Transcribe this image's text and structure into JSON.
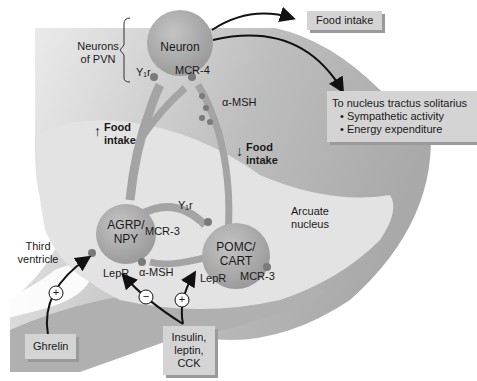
{
  "diagram": {
    "pvn": {
      "group_label_line1": "Neurons",
      "group_label_line2": "of PVN",
      "neuron_label": "Neuron",
      "receptor_mcr4": "MCR-4",
      "receptor_y1r": "Y₁r"
    },
    "outputs": {
      "food_intake_box": "Food intake",
      "nts_box_title": "To nucleus tractus solitarius",
      "nts_box_items": [
        "• Sympathetic activity",
        "• Energy expenditure"
      ]
    },
    "alpha_msh_top": "α-MSH",
    "food_up": {
      "arrow": "↑",
      "line1": "Food",
      "line2": "intake"
    },
    "food_down": {
      "arrow": "↓",
      "line1": "Food",
      "line2": "intake"
    },
    "agrp": {
      "line1": "AGRP/",
      "line2": "NPY",
      "lepr": "LepR",
      "mcr3": "MCR-3"
    },
    "pomc": {
      "line1": "POMC/",
      "line2": "CART",
      "lepr": "LepR",
      "mcr3": "MCR-3",
      "y1r": "Y₁r"
    },
    "alpha_msh_bottom": "α-MSH",
    "arcuate": {
      "line1": "Arcuate",
      "line2": "nucleus"
    },
    "third_ventricle": {
      "line1": "Third",
      "line2": "ventricle"
    },
    "inputs": {
      "ghrelin": "Ghrelin",
      "insulin_line1": "Insulin,",
      "insulin_line2": "leptin,",
      "insulin_line3": "CCK"
    },
    "signs": {
      "plus": "+",
      "minus": "−"
    },
    "colors": {
      "neuron_fill": "#a8a8a8",
      "background_gray": "#bdbdbd",
      "arcuate_fill": "#e2e2e2",
      "box_fill": "#d4d4d4",
      "arrow": "#111111"
    }
  }
}
